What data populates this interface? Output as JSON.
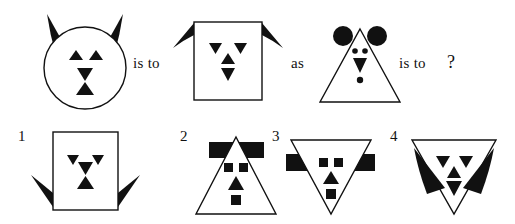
{
  "puzzle": {
    "type": "visual-analogy",
    "connector_1": "is to",
    "connector_2": "as",
    "connector_3": "is to",
    "question_mark": "?",
    "ink_color": "#111111",
    "background_color": "#ffffff"
  },
  "prompt_figures": [
    {
      "position": "A",
      "outline_shape": "circle",
      "ears": {
        "shape": "horn-triangle",
        "count": 2,
        "placement": "top",
        "direction": "up-outward"
      },
      "eyes": {
        "shape": "triangle",
        "direction": "up",
        "count": 2
      },
      "nose": {
        "shape": "triangle",
        "direction": "down",
        "count": 1
      },
      "mouth": {
        "shape": "triangle",
        "direction": "up",
        "count": 1
      }
    },
    {
      "position": "B",
      "outline_shape": "square",
      "ears": {
        "shape": "horn-triangle",
        "count": 2,
        "placement": "top-corners",
        "direction": "down-outward"
      },
      "eyes": {
        "shape": "triangle",
        "direction": "down",
        "count": 2
      },
      "nose": {
        "shape": "triangle",
        "direction": "up",
        "count": 1
      },
      "mouth": {
        "shape": "triangle",
        "direction": "down",
        "count": 1
      }
    },
    {
      "position": "C",
      "outline_shape": "triangle-up",
      "ears": {
        "shape": "circle",
        "count": 2,
        "placement": "top",
        "direction": "outward"
      },
      "eyes": {
        "shape": "dot",
        "direction": "none",
        "count": 2
      },
      "nose": {
        "shape": "triangle",
        "direction": "down",
        "count": 1
      },
      "mouth": {
        "shape": "dot",
        "direction": "none",
        "count": 1
      }
    }
  ],
  "options": [
    {
      "number": "1",
      "outline_shape": "square",
      "ears": {
        "shape": "horn-triangle",
        "count": 2,
        "placement": "bottom-corners",
        "direction": "down-outward"
      },
      "eyes": {
        "shape": "triangle",
        "direction": "down",
        "count": 2
      },
      "nose": {
        "shape": "triangle",
        "direction": "down",
        "count": 1
      },
      "mouth": {
        "shape": "triangle",
        "direction": "up",
        "count": 1
      }
    },
    {
      "number": "2",
      "outline_shape": "triangle-up",
      "ears": {
        "shape": "rectangle",
        "count": 2,
        "placement": "top",
        "direction": "outward"
      },
      "eyes": {
        "shape": "square",
        "direction": "none",
        "count": 2
      },
      "nose": {
        "shape": "triangle",
        "direction": "up",
        "count": 1
      },
      "mouth": {
        "shape": "square",
        "direction": "none",
        "count": 1
      }
    },
    {
      "number": "3",
      "outline_shape": "triangle-down",
      "ears": {
        "shape": "rectangle",
        "count": 2,
        "placement": "sides",
        "direction": "outward"
      },
      "eyes": {
        "shape": "square",
        "direction": "none",
        "count": 2
      },
      "nose": {
        "shape": "triangle",
        "direction": "up",
        "count": 1
      },
      "mouth": {
        "shape": "square",
        "direction": "none",
        "count": 1
      }
    },
    {
      "number": "4",
      "outline_shape": "triangle-down",
      "ears": {
        "shape": "horn-triangle",
        "count": 2,
        "placement": "top-corners",
        "direction": "down-inward"
      },
      "eyes": {
        "shape": "triangle",
        "direction": "down",
        "count": 2
      },
      "nose": {
        "shape": "triangle",
        "direction": "up",
        "count": 1
      },
      "mouth": {
        "shape": "triangle",
        "direction": "down",
        "count": 1
      }
    }
  ]
}
